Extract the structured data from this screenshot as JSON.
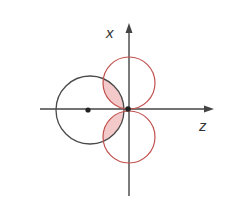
{
  "diagram": {
    "axes": {
      "vertical_label": "x",
      "horizontal_label": "z"
    },
    "colors": {
      "axis": "#444444",
      "black_circle": "#4a4a4a",
      "red_circle": "#c0504d",
      "overlap_fill": "#f3c9c9",
      "dot": "#222222"
    },
    "elements": [
      {
        "kind": "circle",
        "name": "left-black-circle",
        "description": "circle centered on negative z-axis with dot at center, passing through origin"
      },
      {
        "kind": "circle",
        "name": "top-red-circle",
        "description": "red circle tangent to z-axis at origin, above"
      },
      {
        "kind": "circle",
        "name": "bottom-red-circle",
        "description": "red circle tangent to z-axis at origin, below"
      },
      {
        "kind": "region",
        "name": "overlap-regions",
        "description": "shaded intersections of black circle with red circles"
      },
      {
        "kind": "point",
        "name": "origin-dot"
      },
      {
        "kind": "point",
        "name": "left-center-dot"
      }
    ]
  }
}
